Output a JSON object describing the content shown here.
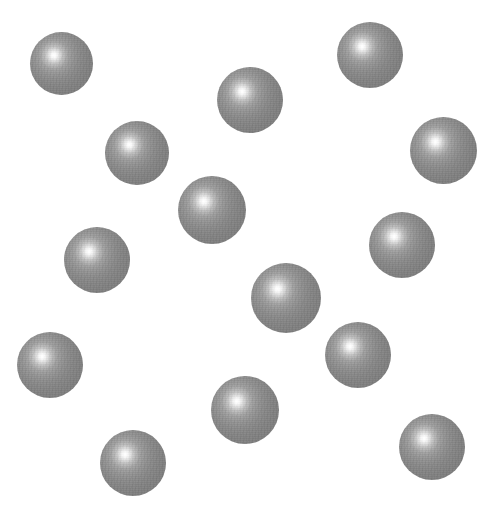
{
  "scene": {
    "title": "Random arrangement of shaded spheres",
    "width": 502,
    "height": 515,
    "background_color": "#ffffff",
    "sphere_count": 14,
    "render_style": "stippled grayscale radial shading",
    "highlight_color": "#ffffff",
    "midtone_color": "#8a8a8a",
    "rim_color": "#5e5e5e",
    "highlight_position": "38% 37%"
  },
  "spheres": [
    {
      "id": "sphere-1",
      "label": "top-left sphere",
      "cx": 61,
      "cy": 63,
      "d": 63
    },
    {
      "id": "sphere-2",
      "label": "top-right sphere",
      "cx": 370,
      "cy": 55,
      "d": 66
    },
    {
      "id": "sphere-3",
      "label": "upper-middle sphere",
      "cx": 250,
      "cy": 100,
      "d": 66
    },
    {
      "id": "sphere-4",
      "label": "right-edge upper sphere",
      "cx": 443,
      "cy": 150,
      "d": 67
    },
    {
      "id": "sphere-5",
      "label": "left-upper sphere",
      "cx": 137,
      "cy": 153,
      "d": 64
    },
    {
      "id": "sphere-6",
      "label": "center-upper sphere",
      "cx": 212,
      "cy": 210,
      "d": 68
    },
    {
      "id": "sphere-7",
      "label": "left-middle sphere",
      "cx": 97,
      "cy": 260,
      "d": 66
    },
    {
      "id": "sphere-8",
      "label": "right-middle sphere",
      "cx": 402,
      "cy": 245,
      "d": 66
    },
    {
      "id": "sphere-9",
      "label": "center sphere",
      "cx": 286,
      "cy": 298,
      "d": 70
    },
    {
      "id": "sphere-10",
      "label": "left-lower sphere",
      "cx": 50,
      "cy": 365,
      "d": 66
    },
    {
      "id": "sphere-11",
      "label": "right-lower sphere",
      "cx": 358,
      "cy": 355,
      "d": 66
    },
    {
      "id": "sphere-12",
      "label": "center-lower sphere",
      "cx": 245,
      "cy": 410,
      "d": 68
    },
    {
      "id": "sphere-13",
      "label": "bottom-left sphere",
      "cx": 133,
      "cy": 463,
      "d": 66
    },
    {
      "id": "sphere-14",
      "label": "bottom-right sphere",
      "cx": 432,
      "cy": 447,
      "d": 66
    }
  ]
}
